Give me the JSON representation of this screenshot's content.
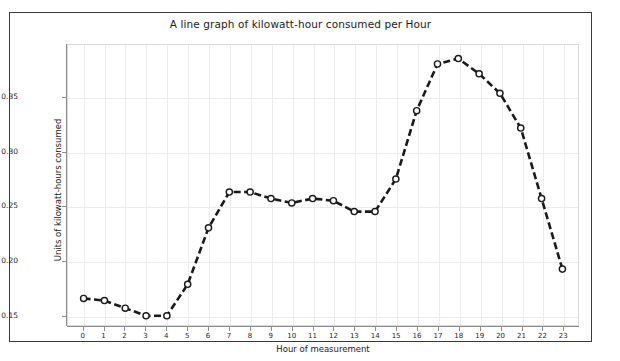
{
  "chart_data": {
    "type": "line",
    "title": "A line graph of kilowatt-hour consumed per Hour",
    "xlabel": "Hour of measurement",
    "ylabel": "Units of kilowatt-hours consumed",
    "x": [
      0,
      1,
      2,
      3,
      4,
      5,
      6,
      7,
      8,
      9,
      10,
      11,
      12,
      13,
      14,
      15,
      16,
      17,
      18,
      19,
      20,
      21,
      22,
      23
    ],
    "values": [
      0.165,
      0.163,
      0.156,
      0.149,
      0.149,
      0.178,
      0.23,
      0.263,
      0.263,
      0.257,
      0.253,
      0.257,
      0.255,
      0.245,
      0.245,
      0.275,
      0.338,
      0.381,
      0.386,
      0.372,
      0.354,
      0.322,
      0.257,
      0.192
    ],
    "xtick_labels": [
      "0",
      "1",
      "2",
      "3",
      "4",
      "5",
      "6",
      "7",
      "8",
      "9",
      "10",
      "11",
      "12",
      "13",
      "14",
      "15",
      "16",
      "17",
      "18",
      "19",
      "20",
      "21",
      "22",
      "23"
    ],
    "ytick_labels": [
      "0.15",
      "0.20",
      "0.25",
      "0.30",
      "0.35"
    ],
    "ytick_values": [
      0.15,
      0.2,
      0.25,
      0.3,
      0.35
    ],
    "ylim": [
      0.1405,
      0.3985
    ],
    "xlim": [
      -0.75,
      23.75
    ],
    "grid": true,
    "legend": "none",
    "line_style": "dashed",
    "marker": "circle-open",
    "line_color": "#1a1a1a",
    "marker_face_color": "#ffffff",
    "marker_edge_color": "#1a1a1a",
    "grid_color": "#ececec",
    "frame_color": "#3a3a3a",
    "background_color": "#ffffff"
  }
}
